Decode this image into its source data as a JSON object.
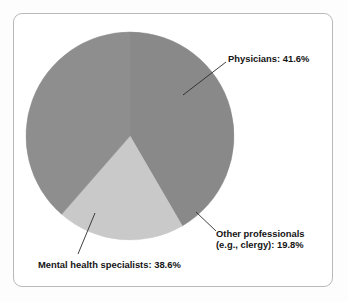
{
  "figure": {
    "background_color": "#fdfdfd",
    "card_background": "#ffffff",
    "card_border_color": "#b9b9b9"
  },
  "chart_data": {
    "type": "pie",
    "title": "",
    "subtitle": "",
    "xlabel": "",
    "ylabel": "",
    "grid": false,
    "legend_position": "none",
    "label_style": "leader-line callouts",
    "units": "percent",
    "total": 100.0,
    "categories": [
      "Physicians",
      "Other professionals (e.g., clergy)",
      "Mental health specialists"
    ],
    "values": [
      41.6,
      19.8,
      38.6
    ],
    "colors": [
      "#898989",
      "#c9c9c9",
      "#8e8e8e"
    ],
    "slices": [
      {
        "name": "Physicians",
        "label": "Physicians: 41.6%",
        "label_lines": [
          "Physicians: 41.6%"
        ],
        "value": 41.6,
        "color": "#898989",
        "start_angle_deg": 0.0,
        "end_angle_deg": 149.8
      },
      {
        "name": "Other professionals (e.g., clergy)",
        "label": "Other professionals (e.g., clergy): 19.8%",
        "label_lines": [
          "Other professionals",
          "(e.g., clergy): 19.8%"
        ],
        "value": 19.8,
        "color": "#c9c9c9",
        "start_angle_deg": 149.8,
        "end_angle_deg": 221.1
      },
      {
        "name": "Mental health specialists",
        "label": "Mental health specialists: 38.6%",
        "label_lines": [
          "Mental health specialists: 38.6%"
        ],
        "value": 38.6,
        "color": "#8e8e8e",
        "start_angle_deg": 221.1,
        "end_angle_deg": 360.0
      }
    ]
  },
  "labels": {
    "physicians": "Physicians: 41.6%",
    "other_line1": "Other professionals",
    "other_line2": "(e.g., clergy): 19.8%",
    "mental_health": "Mental health specialists: 38.6%"
  }
}
